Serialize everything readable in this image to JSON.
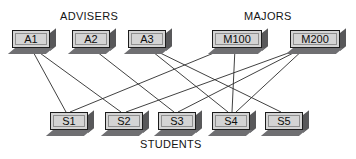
{
  "diagram": {
    "type": "bipartite-relationship-diagram",
    "captions": {
      "advisers": "ADVISERS",
      "majors": "MAJORS",
      "students": "STUDENTS"
    },
    "colors": {
      "box_face": "#d4d4d4",
      "box_border": "#1d1d1d",
      "box_shadow_right": "#58585a",
      "box_shadow_bottom": "#6f6f72",
      "edge": "#2b2b2b",
      "background": "#ffffff",
      "text": "#0d0d0d"
    },
    "advisers": [
      {
        "id": "A1",
        "label": "A1",
        "x": 12,
        "y": 30,
        "w": 38,
        "h": 18
      },
      {
        "id": "A2",
        "label": "A2",
        "x": 72,
        "y": 30,
        "w": 38,
        "h": 18
      },
      {
        "id": "A3",
        "label": "A3",
        "x": 128,
        "y": 30,
        "w": 38,
        "h": 18
      }
    ],
    "majors": [
      {
        "id": "M100",
        "label": "M100",
        "x": 212,
        "y": 30,
        "w": 50,
        "h": 18
      },
      {
        "id": "M200",
        "label": "M200",
        "x": 290,
        "y": 30,
        "w": 50,
        "h": 18
      }
    ],
    "students": [
      {
        "id": "S1",
        "label": "S1",
        "x": 50,
        "y": 112,
        "w": 38,
        "h": 18
      },
      {
        "id": "S2",
        "label": "S2",
        "x": 105,
        "y": 112,
        "w": 38,
        "h": 18
      },
      {
        "id": "S3",
        "label": "S3",
        "x": 158,
        "y": 112,
        "w": 38,
        "h": 18
      },
      {
        "id": "S4",
        "label": "S4",
        "x": 212,
        "y": 112,
        "w": 38,
        "h": 18
      },
      {
        "id": "S5",
        "label": "S5",
        "x": 265,
        "y": 112,
        "w": 38,
        "h": 18
      }
    ],
    "edges": [
      {
        "from": "A1",
        "to": "S1",
        "x1": 31,
        "y1": 48,
        "x2": 66,
        "y2": 112
      },
      {
        "from": "A1",
        "to": "S2",
        "x1": 33,
        "y1": 48,
        "x2": 121,
        "y2": 112
      },
      {
        "from": "A2",
        "to": "S3",
        "x1": 92,
        "y1": 48,
        "x2": 174,
        "y2": 112
      },
      {
        "from": "A3",
        "to": "S4",
        "x1": 148,
        "y1": 48,
        "x2": 228,
        "y2": 112
      },
      {
        "from": "A3",
        "to": "S5",
        "x1": 150,
        "y1": 48,
        "x2": 281,
        "y2": 112
      },
      {
        "from": "M100",
        "to": "S1",
        "x1": 226,
        "y1": 48,
        "x2": 70,
        "y2": 112
      },
      {
        "from": "M100",
        "to": "S4",
        "x1": 235,
        "y1": 48,
        "x2": 232,
        "y2": 112
      },
      {
        "from": "M200",
        "to": "S2",
        "x1": 302,
        "y1": 48,
        "x2": 126,
        "y2": 112
      },
      {
        "from": "M200",
        "to": "S3",
        "x1": 303,
        "y1": 48,
        "x2": 178,
        "y2": 112
      },
      {
        "from": "M200",
        "to": "S4",
        "x1": 305,
        "y1": 48,
        "x2": 236,
        "y2": 112
      }
    ],
    "caption_positions": {
      "advisers": {
        "x": 60,
        "y": 10
      },
      "majors": {
        "x": 244,
        "y": 10
      },
      "students": {
        "x": 140,
        "y": 138
      }
    }
  }
}
